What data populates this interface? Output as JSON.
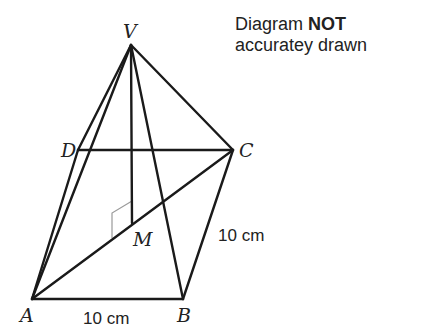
{
  "note": {
    "line1_prefix": "Diagram",
    "line1_bold": "NOT",
    "line2": "accuratey drawn"
  },
  "vertices": {
    "V": {
      "label": "V",
      "x": 131,
      "y": 45
    },
    "D": {
      "label": "D",
      "x": 78,
      "y": 150
    },
    "C": {
      "label": "C",
      "x": 233,
      "y": 150
    },
    "A": {
      "label": "A",
      "x": 32,
      "y": 299
    },
    "B": {
      "label": "B",
      "x": 183,
      "y": 299
    },
    "M": {
      "label": "M",
      "x": 132,
      "y": 223
    }
  },
  "edges": [
    [
      "V",
      "A"
    ],
    [
      "V",
      "D"
    ],
    [
      "V",
      "C"
    ],
    [
      "V",
      "B"
    ],
    [
      "V",
      "M"
    ],
    [
      "D",
      "C"
    ],
    [
      "D",
      "A"
    ],
    [
      "A",
      "B"
    ],
    [
      "B",
      "C"
    ],
    [
      "A",
      "C"
    ]
  ],
  "dimensions": {
    "AB": "10 cm",
    "BC": "10 cm"
  },
  "right_angle_at": "M",
  "colors": {
    "line": "#1a1a1a",
    "marker": "#9a9a9a",
    "text": "#222222"
  }
}
